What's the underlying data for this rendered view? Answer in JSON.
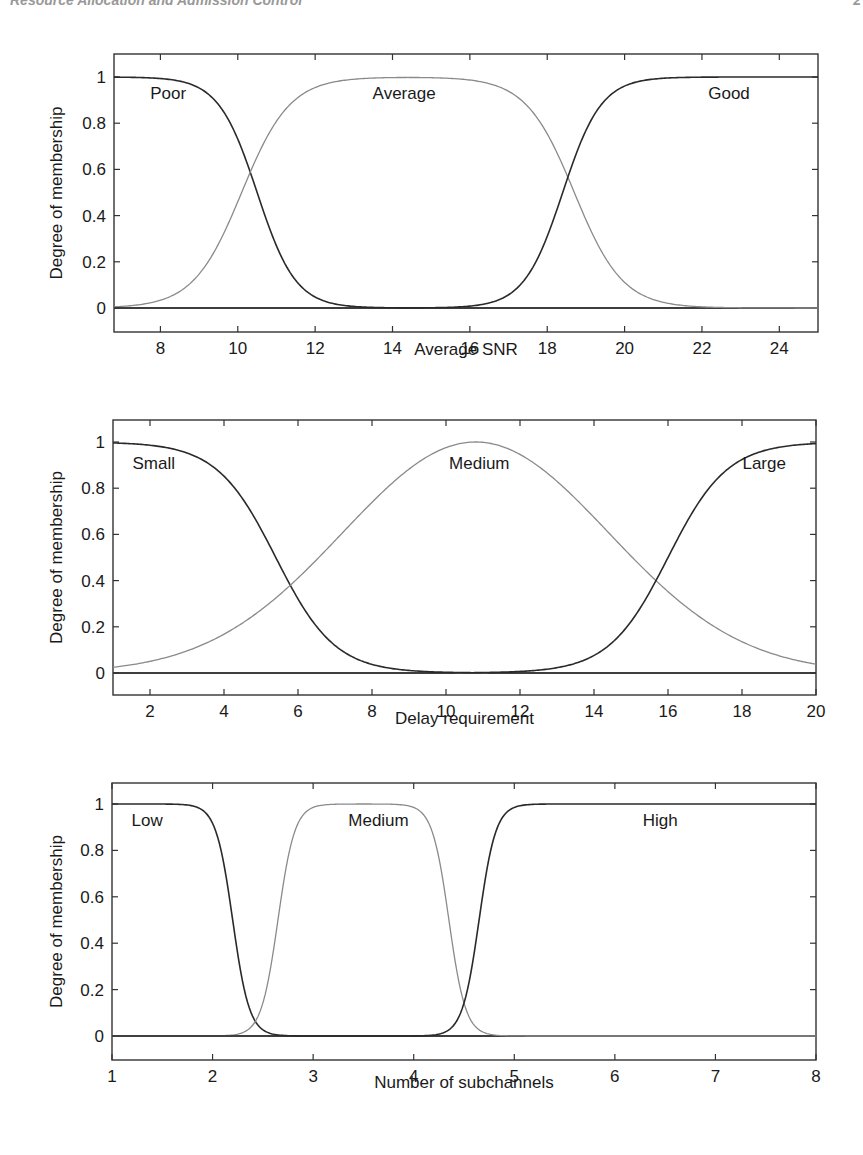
{
  "page": {
    "header_left": "Resource Allocation and Admission Control",
    "header_right": "2"
  },
  "chart_data": [
    {
      "type": "line",
      "title": "",
      "xlabel": "Average SNR",
      "ylabel": "Degree of membership",
      "xlim": [
        6.8,
        25
      ],
      "ylim": [
        -0.1,
        1.1
      ],
      "xticks": [
        8,
        10,
        12,
        14,
        16,
        18,
        20,
        22,
        24
      ],
      "yticks": [
        0,
        0.2,
        0.4,
        0.6,
        0.8,
        1
      ],
      "ytick_labels": [
        "0",
        "0.2",
        "0.4",
        "0.6",
        "0.8",
        "1"
      ],
      "grid": false,
      "legend": "none (inline labels)",
      "series": [
        {
          "name": "Poor",
          "shape": "z-sigmoid",
          "color": "#2a2a2a",
          "params": {
            "center": 10.5,
            "slope": 2.0
          },
          "x": [
            6.8,
            8,
            9,
            9.5,
            10,
            10.3,
            10.5,
            11,
            11.5,
            12,
            13,
            14,
            25
          ],
          "values": [
            1,
            1,
            0.97,
            0.9,
            0.73,
            0.6,
            0.5,
            0.27,
            0.12,
            0.05,
            0.01,
            0,
            0
          ]
        },
        {
          "name": "Average",
          "shape": "pi-shaped",
          "color": "#8a8a8a",
          "params": {
            "rise_center": 10.1,
            "fall_center": 18.7,
            "slope": 1.6
          },
          "x": [
            6.8,
            8,
            9,
            10,
            10.3,
            11,
            12,
            14,
            16,
            17,
            18,
            18.7,
            19.5,
            20,
            22,
            25
          ],
          "values": [
            0.01,
            0.03,
            0.15,
            0.46,
            0.6,
            0.8,
            0.95,
            1,
            1,
            0.94,
            0.75,
            0.5,
            0.22,
            0.11,
            0.01,
            0
          ]
        },
        {
          "name": "Good",
          "shape": "s-sigmoid",
          "color": "#2a2a2a",
          "params": {
            "center": 18.4,
            "slope": 2.0
          },
          "x": [
            6.8,
            16,
            17,
            18,
            18.4,
            19,
            20,
            21,
            25
          ],
          "values": [
            0,
            0,
            0.05,
            0.3,
            0.5,
            0.77,
            0.96,
            1,
            1
          ]
        }
      ],
      "annotations": [
        {
          "text": "Poor",
          "x": 8.2,
          "y": 0.93
        },
        {
          "text": "Average",
          "x": 14.3,
          "y": 0.93
        },
        {
          "text": "Good",
          "x": 22.7,
          "y": 0.93
        }
      ]
    },
    {
      "type": "line",
      "title": "",
      "xlabel": "Delay requirement",
      "ylabel": "Degree of membership",
      "xlim": [
        1,
        20
      ],
      "ylim": [
        -0.1,
        1.1
      ],
      "xticks": [
        2,
        4,
        6,
        8,
        10,
        12,
        14,
        16,
        18,
        20
      ],
      "yticks": [
        0,
        0.2,
        0.4,
        0.6,
        0.8,
        1
      ],
      "ytick_labels": [
        "0",
        "0.2",
        "0.4",
        "0.6",
        "0.8",
        "1"
      ],
      "grid": false,
      "legend": "none (inline labels)",
      "series": [
        {
          "name": "Small",
          "shape": "z-sigmoid",
          "color": "#2a2a2a",
          "params": {
            "center": 5.4,
            "slope": 1.25
          },
          "x": [
            1,
            2,
            3,
            4,
            5,
            5.5,
            6,
            7,
            8,
            9,
            10,
            11,
            20
          ],
          "values": [
            1,
            0.99,
            0.98,
            0.88,
            0.65,
            0.52,
            0.38,
            0.15,
            0.07,
            0.03,
            0.01,
            0,
            0
          ]
        },
        {
          "name": "Medium",
          "shape": "gaussian",
          "color": "#8a8a8a",
          "params": {
            "center": 10.8,
            "sigma": 3.6
          },
          "x": [
            1,
            2,
            4,
            6,
            8,
            10,
            10.8,
            12,
            14,
            15.5,
            16,
            18,
            20
          ],
          "values": [
            0.02,
            0.05,
            0.17,
            0.4,
            0.74,
            0.98,
            1,
            0.95,
            0.68,
            0.42,
            0.35,
            0.14,
            0.02
          ]
        },
        {
          "name": "Large",
          "shape": "s-sigmoid",
          "color": "#2a2a2a",
          "params": {
            "center": 16.0,
            "slope": 1.25
          },
          "x": [
            1,
            11,
            12,
            13,
            14,
            15,
            15.4,
            16,
            17,
            18,
            19,
            20
          ],
          "values": [
            0,
            0,
            0.01,
            0.03,
            0.09,
            0.27,
            0.4,
            0.55,
            0.82,
            0.96,
            0.99,
            1
          ]
        }
      ],
      "annotations": [
        {
          "text": "Small",
          "x": 2.1,
          "y": 0.91
        },
        {
          "text": "Medium",
          "x": 10.9,
          "y": 0.91
        },
        {
          "text": "Large",
          "x": 18.6,
          "y": 0.91
        }
      ]
    },
    {
      "type": "line",
      "title": "",
      "xlabel": "Number of subchannels",
      "ylabel": "Degree of membership",
      "xlim": [
        1,
        8
      ],
      "ylim": [
        -0.1,
        1.1
      ],
      "xticks": [
        1,
        2,
        3,
        4,
        5,
        6,
        7,
        8
      ],
      "yticks": [
        0,
        0.2,
        0.4,
        0.6,
        0.8,
        1
      ],
      "ytick_labels": [
        "0",
        "0.2",
        "0.4",
        "0.6",
        "0.8",
        "1"
      ],
      "grid": false,
      "legend": "none (inline labels)",
      "series": [
        {
          "name": "Low",
          "shape": "z-sigmoid",
          "color": "#2a2a2a",
          "params": {
            "center": 2.2,
            "slope": 12
          },
          "x": [
            1,
            1.8,
            1.9,
            2.0,
            2.1,
            2.2,
            2.3,
            2.4,
            2.5,
            2.6,
            2.8,
            8
          ],
          "values": [
            1,
            0.99,
            0.97,
            0.9,
            0.76,
            0.5,
            0.24,
            0.1,
            0.06,
            0.02,
            0,
            0
          ]
        },
        {
          "name": "Medium",
          "shape": "pi-shaped",
          "color": "#8a8a8a",
          "params": {
            "rise_center": 2.65,
            "fall_center": 4.35,
            "slope": 12
          },
          "x": [
            1,
            2.3,
            2.5,
            2.6,
            2.7,
            2.8,
            2.9,
            3.0,
            4.1,
            4.2,
            4.3,
            4.4,
            4.5,
            4.6,
            4.8,
            8
          ],
          "values": [
            0,
            0.02,
            0.08,
            0.3,
            0.6,
            0.85,
            0.96,
            1,
            0.97,
            0.85,
            0.6,
            0.3,
            0.1,
            0.05,
            0.01,
            0
          ]
        },
        {
          "name": "High",
          "shape": "s-sigmoid",
          "color": "#2a2a2a",
          "params": {
            "center": 4.65,
            "slope": 12
          },
          "x": [
            1,
            4.2,
            4.4,
            4.5,
            4.6,
            4.7,
            4.8,
            4.9,
            5.0,
            5.2,
            8
          ],
          "values": [
            0,
            0.01,
            0.05,
            0.1,
            0.35,
            0.65,
            0.85,
            0.95,
            0.98,
            1,
            1
          ]
        }
      ],
      "annotations": [
        {
          "text": "Low",
          "x": 1.35,
          "y": 0.93
        },
        {
          "text": "Medium",
          "x": 3.65,
          "y": 0.93
        },
        {
          "text": "High",
          "x": 6.45,
          "y": 0.93
        }
      ]
    }
  ],
  "layout": {
    "charts": [
      {
        "px_left": 114,
        "px_right": 818,
        "px_top": 54,
        "px_bottom": 332,
        "px_y1": 77,
        "px_y0": 308,
        "xlabel_y": 352
      },
      {
        "px_left": 113,
        "px_right": 816,
        "px_top": 420,
        "px_bottom": 695,
        "px_y1": 442,
        "px_y0": 673,
        "xlabel_y": 721
      },
      {
        "px_left": 112,
        "px_right": 816,
        "px_top": 783,
        "px_bottom": 1060,
        "px_y1": 804,
        "px_y0": 1036,
        "xlabel_y": 1085
      }
    ]
  }
}
